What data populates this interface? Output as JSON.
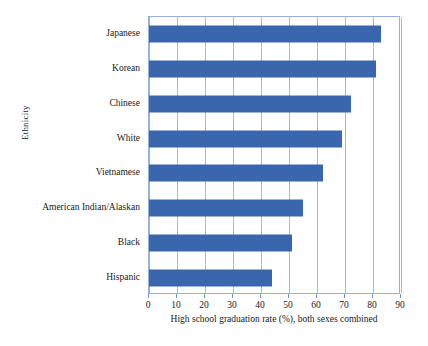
{
  "chart_data": {
    "type": "bar",
    "orientation": "horizontal",
    "title": "",
    "xlabel": "High school graduation rate (%), both sexes combined",
    "ylabel": "Ethnicity",
    "categories": [
      "Japanese",
      "Korean",
      "Chinese",
      "White",
      "Vietnamese",
      "American Indian/Alaskan",
      "Black",
      "Hispanic"
    ],
    "values": [
      83,
      81,
      72,
      69,
      62,
      55,
      51,
      44
    ],
    "xlim": [
      0,
      90
    ],
    "xticks": [
      0,
      10,
      20,
      30,
      40,
      50,
      60,
      70,
      80,
      90
    ],
    "xtick_labels": [
      "0",
      "10",
      "20",
      "30",
      "40",
      "50",
      "60",
      "70",
      "80",
      "90"
    ],
    "grid": "vertical",
    "legend": "none",
    "bar_color": "#3a66ad",
    "grid_color": "#9dbee3",
    "frame_color": "#8fb4dd",
    "background": "#ffffff"
  }
}
